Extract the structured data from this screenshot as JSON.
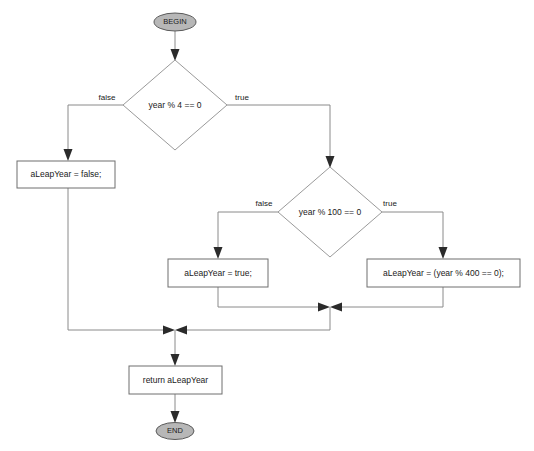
{
  "diagram": {
    "type": "flowchart",
    "colors": {
      "terminator_fill": "#b7b7b7",
      "terminator_stroke": "#5a5a5a",
      "process_fill": "#ffffff",
      "process_stroke": "#6e6e6e",
      "decision_fill": "#ffffff",
      "decision_stroke": "#9a9a9a",
      "connector_stroke": "#8a8a8a",
      "arrow_fill": "#2b2b2b",
      "text": "#1a1a1a",
      "background": "#ffffff"
    }
  },
  "nodes": {
    "begin": {
      "label": "BEGIN",
      "shape": "terminator"
    },
    "decision_year_mod_4": {
      "label": "year % 4 == 0",
      "shape": "decision"
    },
    "set_false": {
      "label": "aLeapYear = false;",
      "shape": "process"
    },
    "decision_year_mod_100": {
      "label": "year % 100 == 0",
      "shape": "decision"
    },
    "set_true": {
      "label": "aLeapYear = true;",
      "shape": "process"
    },
    "set_mod_400": {
      "label": "aLeapYear = (year % 400 == 0);",
      "shape": "process"
    },
    "return_value": {
      "label": "return aLeapYear",
      "shape": "process"
    },
    "end": {
      "label": "END",
      "shape": "terminator"
    }
  },
  "edge_labels": {
    "d1_false": "false",
    "d1_true": "true",
    "d2_false": "false",
    "d2_true": "true"
  }
}
